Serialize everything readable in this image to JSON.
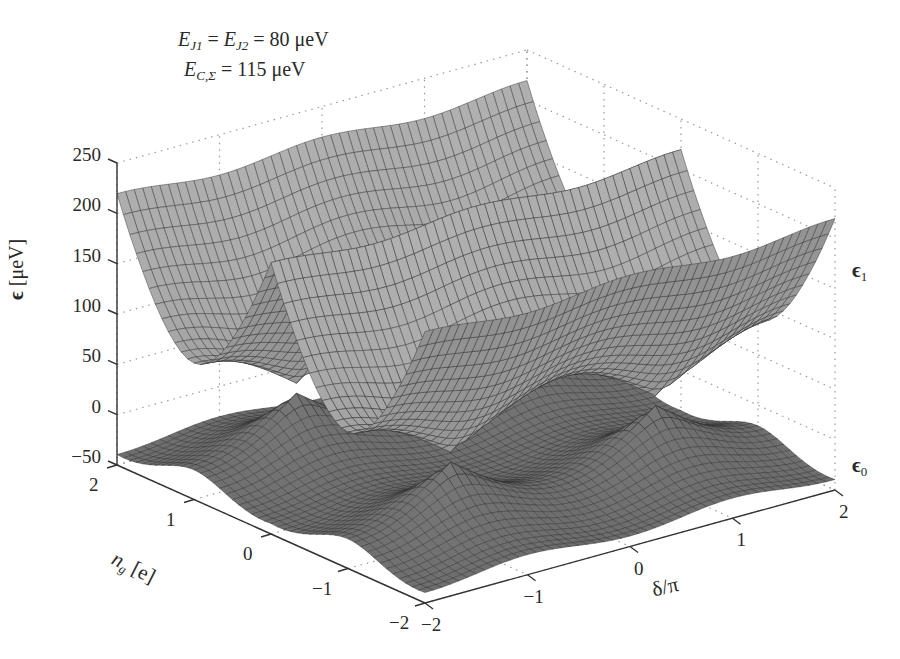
{
  "chart_data": {
    "type": "surface3d",
    "title": "",
    "annotations": [
      {
        "id": "ej",
        "text_parts": [
          "E",
          "J1",
          " = ",
          "E",
          "J2",
          " = 80 μeV"
        ]
      },
      {
        "id": "ec",
        "text_parts": [
          "E",
          "C,Σ",
          " = 115 μeV"
        ]
      }
    ],
    "parameters": {
      "E_J1_ueV": 80,
      "E_J2_ueV": 80,
      "E_C_sigma_ueV": 115
    },
    "zlabel": "ϵ [μeV]",
    "zlabel_symbol": "ϵ",
    "zlabel_unit": "[μeV]",
    "zlim": [
      -50,
      250
    ],
    "zticks": [
      -50,
      0,
      50,
      100,
      150,
      200,
      250
    ],
    "ylabel": "n_g [e]",
    "ylabel_main": "n",
    "ylabel_sub": "g",
    "ylabel_unit": "[e]",
    "ylim": [
      -2,
      2
    ],
    "yticks": [
      2,
      1,
      0,
      -1,
      -2
    ],
    "xlabel": "δ/π",
    "xlim": [
      -2,
      2
    ],
    "xticks": [
      -2,
      -1,
      0,
      1,
      2
    ],
    "series": [
      {
        "name": "ϵ1",
        "label_main": "ϵ",
        "label_sub": "1",
        "description": "first excited band",
        "range_ueV": [
          10,
          230
        ]
      },
      {
        "name": "ϵ0",
        "label_main": "ϵ",
        "label_sub": "0",
        "description": "ground band",
        "range_ueV": [
          -50,
          45
        ]
      }
    ],
    "grid": true,
    "colormap": "gray",
    "legend_position": "right"
  },
  "ui": {
    "surface_color_light": "#c8c8c8",
    "surface_color_dark": "#3a3a3a",
    "axis_color": "#333333",
    "grid_color": "#9a9a9a"
  }
}
